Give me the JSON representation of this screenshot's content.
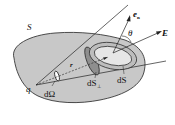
{
  "diagram": {
    "type": "gauss-law-solid-angle",
    "labels": {
      "surface": "S",
      "charge": "q",
      "solid_angle": "dΩ",
      "radius": "r",
      "normal": "e",
      "normal_sub": "n",
      "angle": "θ",
      "field": "E",
      "area_perp": "dS",
      "area_perp_sub": "⊥",
      "area": "dS"
    },
    "colors": {
      "surface_fill": "#c8c8c8",
      "surface_stroke": "#222222",
      "cone_fill": "#9a9a9a",
      "ellipse_fill": "#e6e6e6",
      "line": "#222222"
    }
  }
}
